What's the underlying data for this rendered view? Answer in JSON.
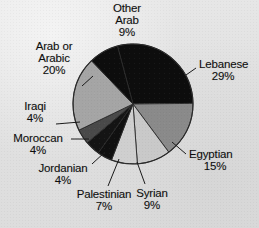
{
  "chart_data": {
    "type": "pie",
    "title": "",
    "legend_position": "outside-labels",
    "total_percent": 101,
    "categories": [
      "Lebanese",
      "Arab or Arabic",
      "Egyptian",
      "Other Arab",
      "Syrian",
      "Palestinian",
      "Jordanian",
      "Moroccan",
      "Iraqi"
    ],
    "values": [
      29,
      20,
      15,
      9,
      9,
      7,
      4,
      4,
      4
    ],
    "slices": [
      {
        "label": "Lebanese",
        "pct_text": "29%",
        "value": 29,
        "color": "#0d0d0d",
        "start_deg": -15.0,
        "end_deg": 89.4
      },
      {
        "label": "Egyptian",
        "pct_text": "15%",
        "value": 15,
        "color": "#8a8a8a",
        "start_deg": 89.4,
        "end_deg": 143.4
      },
      {
        "label": "Syrian",
        "pct_text": "9%",
        "value": 9,
        "color": "#c9c9c9",
        "start_deg": 143.4,
        "end_deg": 175.8
      },
      {
        "label": "Palestinian",
        "pct_text": "7%",
        "value": 7,
        "color": "#cfcfcf",
        "start_deg": 175.8,
        "end_deg": 201.0
      },
      {
        "label": "Jordanian",
        "pct_text": "4%",
        "value": 4,
        "color": "#101010",
        "start_deg": 201.0,
        "end_deg": 215.4
      },
      {
        "label": "Moroccan",
        "pct_text": "4%",
        "value": 4,
        "color": "#141414",
        "start_deg": 215.4,
        "end_deg": 229.8
      },
      {
        "label": "Iraqi",
        "pct_text": "4%",
        "value": 4,
        "color": "#4a4a4a",
        "start_deg": 229.8,
        "end_deg": 244.2
      },
      {
        "label": "Arab or Arabic",
        "pct_text": "20%",
        "value": 20,
        "color": "#a5a5a5",
        "start_deg": 244.2,
        "end_deg": 316.2
      },
      {
        "label": "Other Arab",
        "pct_text": "9%",
        "value": 9,
        "color": "#0d0d0d",
        "start_deg": 316.2,
        "end_deg": 345.0
      }
    ],
    "colors": {
      "background": "#e3e3e3",
      "black_slice": "#0d0d0d",
      "dark_gray_slice": "#4a4a4a",
      "mid_gray_slice": "#8a8a8a",
      "light_gray_slice": "#c9c9c9",
      "outline": "#2a2a2a",
      "label_text": "#0d0d0d"
    }
  },
  "labels": {
    "other_arab": {
      "line1": "Other",
      "line2": "Arab",
      "pct": "9%"
    },
    "lebanese": {
      "line1": "Lebanese",
      "pct": "29%"
    },
    "egyptian": {
      "line1": "Egyptian",
      "pct": "15%"
    },
    "syrian": {
      "line1": "Syrian",
      "pct": "9%"
    },
    "palestinian": {
      "line1": "Palestinian",
      "pct": "7%"
    },
    "jordanian": {
      "line1": "Jordanian",
      "pct": "4%"
    },
    "moroccan": {
      "line1": "Moroccan",
      "pct": "4%"
    },
    "iraqi": {
      "line1": "Iraqi",
      "pct": "4%"
    },
    "arab_or_arabic": {
      "line1": "Arab or",
      "line2": "Arabic",
      "pct": "20%"
    }
  }
}
